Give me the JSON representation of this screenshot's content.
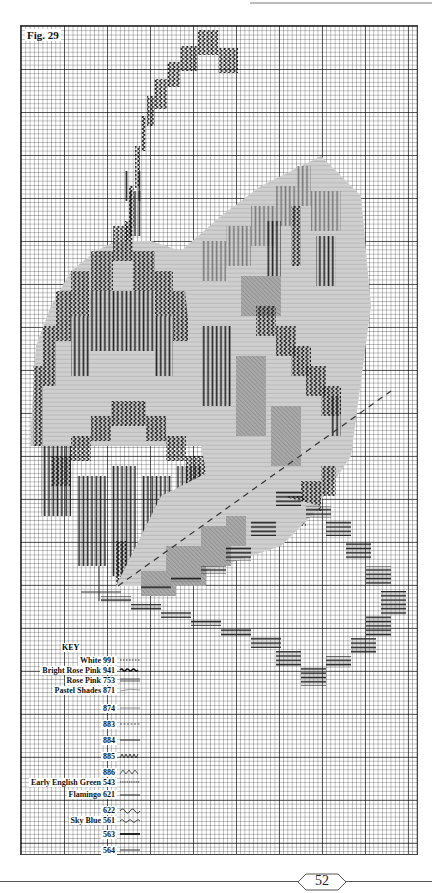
{
  "figure": {
    "label": "Fig. 29",
    "page_number": "52"
  },
  "key": {
    "title": "KEY",
    "items": [
      {
        "label": "White 991",
        "stitch": "dotted"
      },
      {
        "label": "Bright Rose Pink 941",
        "stitch": "wavy-bold"
      },
      {
        "label": "Rose Pink 753",
        "stitch": "double-line"
      },
      {
        "label": "Pastel Shades 871",
        "stitch": "thin-curve"
      },
      {
        "label": "874",
        "stitch": "thin-line"
      },
      {
        "label": "883",
        "stitch": "dashed"
      },
      {
        "label": "884",
        "stitch": "medium-line"
      },
      {
        "label": "885",
        "stitch": "zigzag"
      },
      {
        "label": "886",
        "stitch": "zigzag-open"
      },
      {
        "label": "Early English Green 543",
        "stitch": "beaded"
      },
      {
        "label": "Flamingo 621",
        "stitch": "solid-line"
      },
      {
        "label": "622",
        "stitch": "wave"
      },
      {
        "label": "Sky Blue 561",
        "stitch": "small-wave"
      },
      {
        "label": "563",
        "stitch": "bold-line"
      },
      {
        "label": "564",
        "stitch": "line"
      }
    ]
  },
  "colors": {
    "ink": "#111111",
    "grid_major": "#555555",
    "grid_minor": "#9a9a9a",
    "shade_light": "#c8c8c8",
    "shade_mid": "#8a8a8a"
  }
}
